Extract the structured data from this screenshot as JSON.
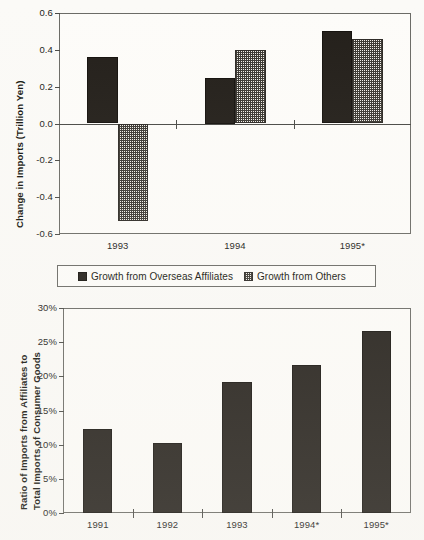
{
  "chart_data": [
    {
      "id": "top",
      "type": "bar",
      "title": "",
      "xlabel": "",
      "ylabel": "Change in Imports (Trillion Yen)",
      "ylim": [
        -0.6,
        0.6
      ],
      "ytick_labels": [
        "0.6",
        "0.4",
        "0.2",
        "0.0",
        "-0.2",
        "-0.4",
        "-0.6"
      ],
      "ytick_values": [
        0.6,
        0.4,
        0.2,
        0.0,
        -0.2,
        -0.4,
        -0.6
      ],
      "grid": false,
      "legend_position": "below-plot",
      "categories": [
        "1993",
        "1994",
        "1995*"
      ],
      "series": [
        {
          "name": "Growth from Overseas Affiliates",
          "fill": "solid-black",
          "values": [
            0.36,
            0.25,
            0.5
          ]
        },
        {
          "name": "Growth from Others",
          "fill": "checker-hatch",
          "values": [
            -0.53,
            0.4,
            0.46
          ]
        }
      ]
    },
    {
      "id": "bottom",
      "type": "bar",
      "title": "",
      "xlabel": "",
      "ylabel": "Ratio of Imports from Affiliates to\nTotal Imports of Consumer Goods",
      "ylabel_line1": "Ratio of Imports from Affiliates to",
      "ylabel_line2": "Total Imports of Consumer Goods",
      "ylim": [
        0,
        30
      ],
      "yunit": "%",
      "ytick_labels": [
        "30%",
        "25%",
        "20%",
        "15%",
        "10%",
        "5%",
        "0%"
      ],
      "ytick_values": [
        30,
        25,
        20,
        15,
        10,
        5,
        0
      ],
      "grid": false,
      "categories": [
        "1991",
        "1992",
        "1993",
        "1994*",
        "1995*"
      ],
      "series": [
        {
          "name": "Ratio of Imports from Affiliates",
          "fill": "solid-black",
          "values": [
            12.3,
            10.3,
            19.2,
            21.7,
            26.7
          ]
        }
      ]
    }
  ],
  "colors": {
    "series_solid": "#231f1a",
    "series_hatch": "#3c3933",
    "axis": "#4a4a46",
    "frame": "#6b6b66",
    "plot_background": "#fdfcf9",
    "page_background": "#fbfaf7",
    "text": "#15150f"
  }
}
